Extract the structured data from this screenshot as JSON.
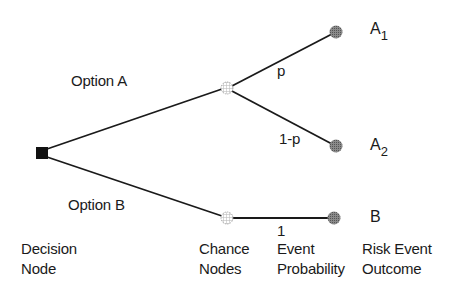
{
  "diagram": {
    "type": "decision-tree",
    "colors": {
      "line": "#1a1a1a",
      "decision_node": "#111111",
      "chance_node_stroke": "#999999",
      "outcome_node": "#777777"
    },
    "nodes": {
      "decision": {
        "kind": "decision",
        "shape": "square"
      },
      "chance_a": {
        "kind": "chance",
        "shape": "circle-hatched"
      },
      "chance_b": {
        "kind": "chance",
        "shape": "circle-hatched"
      },
      "outcome_a1": {
        "kind": "outcome",
        "shape": "circle-filled",
        "label": "A",
        "subscript": "1"
      },
      "outcome_a2": {
        "kind": "outcome",
        "shape": "circle-filled",
        "label": "A",
        "subscript": "2"
      },
      "outcome_b": {
        "kind": "outcome",
        "shape": "circle-filled",
        "label": "B"
      }
    },
    "edges": {
      "option_a": {
        "from": "decision",
        "to": "chance_a",
        "label": "Option A"
      },
      "option_b": {
        "from": "decision",
        "to": "chance_b",
        "label": "Option B"
      },
      "a_to_a1": {
        "from": "chance_a",
        "to": "outcome_a1",
        "label": "p"
      },
      "a_to_a2": {
        "from": "chance_a",
        "to": "outcome_a2",
        "label": "1-p"
      },
      "b_to_b": {
        "from": "chance_b",
        "to": "outcome_b",
        "label": "1"
      }
    },
    "legend": {
      "decision_node": [
        "Decision",
        "Node"
      ],
      "chance_nodes": [
        "Chance",
        "Nodes"
      ],
      "event_probability": [
        "Event",
        "Probability"
      ],
      "risk_event_outcome": [
        "Risk Event",
        "Outcome"
      ]
    }
  }
}
